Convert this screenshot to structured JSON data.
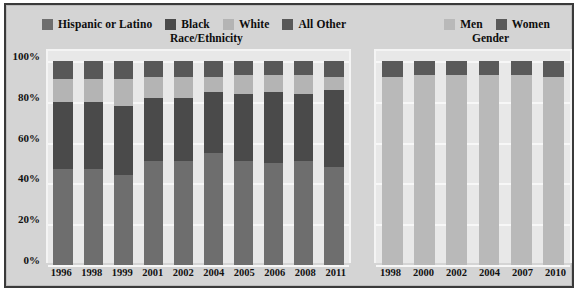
{
  "chart_data": {
    "type": "bar",
    "subtype": "stacked-percentage",
    "title": "",
    "xlabel": "",
    "ylabel": "",
    "ylim": [
      0,
      100
    ],
    "ytick_labels": [
      "100%",
      "80%",
      "60%",
      "40%",
      "20%",
      "0%"
    ],
    "ytick_values": [
      100,
      80,
      60,
      40,
      20,
      0
    ],
    "grid": true,
    "legend_position": "top",
    "panels": [
      {
        "name": "race-ethnicity",
        "group_title": "Race/Ethnicity",
        "legend": [
          {
            "label": "Hispanic or Latino",
            "color": "#6e6e6e"
          },
          {
            "label": "Black",
            "color": "#4a4a4a"
          },
          {
            "label": "White",
            "color": "#b4b4b4"
          },
          {
            "label": "All Other",
            "color": "#585858"
          }
        ],
        "categories": [
          "1996",
          "1998",
          "1999",
          "2001",
          "2002",
          "2004",
          "2005",
          "2006",
          "2008",
          "2011"
        ],
        "series": [
          {
            "name": "Hispanic or Latino",
            "color": "#6e6e6e",
            "values": [
              47,
              47,
              44,
              51,
              51,
              55,
              51,
              50,
              51,
              48
            ]
          },
          {
            "name": "Black",
            "color": "#4a4a4a",
            "values": [
              33,
              33,
              34,
              31,
              31,
              30,
              33,
              35,
              33,
              38
            ]
          },
          {
            "name": "White",
            "color": "#b4b4b4",
            "values": [
              11,
              11,
              13,
              10,
              10,
              7,
              9,
              8,
              9,
              6
            ]
          },
          {
            "name": "All Other",
            "color": "#585858",
            "values": [
              9,
              9,
              9,
              8,
              8,
              8,
              7,
              7,
              7,
              8
            ]
          }
        ]
      },
      {
        "name": "gender",
        "group_title": "Gender",
        "legend": [
          {
            "label": "Men",
            "color": "#b9b9b9"
          },
          {
            "label": "Women",
            "color": "#5a5a5a"
          }
        ],
        "categories": [
          "1998",
          "2000",
          "2002",
          "2004",
          "2007",
          "2010"
        ],
        "series": [
          {
            "name": "Men",
            "color": "#b9b9b9",
            "values": [
              92,
              93,
              93,
              93,
              93,
              92
            ]
          },
          {
            "name": "Women",
            "color": "#5a5a5a",
            "values": [
              8,
              7,
              7,
              7,
              7,
              8
            ]
          }
        ]
      }
    ]
  },
  "colors": {
    "background": "#d4d4d4",
    "plot_background": "#e8e8e8",
    "gridline": "#f7f7f7",
    "frame_border": "#3a3a3a",
    "text": "#0d0d0d"
  }
}
